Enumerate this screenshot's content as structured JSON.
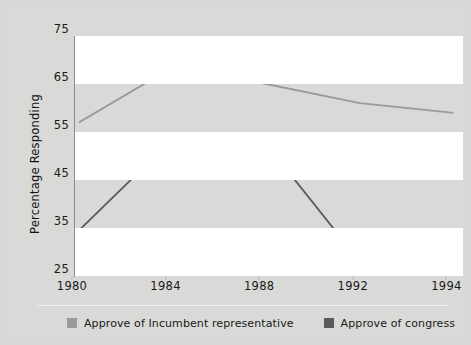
{
  "chart_data": {
    "type": "line",
    "title": "",
    "xlabel": "",
    "ylabel": "Percentage Responding",
    "x": [
      "1980",
      "1984",
      "1988",
      "1992",
      "1994"
    ],
    "categories": [
      "1980",
      "1984",
      "1988",
      "1992",
      "1994"
    ],
    "xtick_labels": [
      "1980",
      "1984",
      "1988",
      "1992",
      "1994"
    ],
    "ytick_labels": [
      "75",
      "65",
      "55",
      "45",
      "35",
      "25"
    ],
    "ytick_values": [
      75,
      65,
      55,
      45,
      35,
      25
    ],
    "ylim": [
      25,
      75
    ],
    "grid": false,
    "banded_background": true,
    "legend_position": "bottom-left",
    "series": [
      {
        "name": "Approve of Incumbent representative",
        "color": "#9a9a9a",
        "values": [
          57,
          68.5,
          65,
          61,
          59
        ]
      },
      {
        "name": "Approve of congress",
        "color": "#5a5a5a",
        "values": [
          34.5,
          53.5,
          52.5,
          28,
          30
        ]
      }
    ]
  },
  "axis": {
    "y_title": "Percentage Responding",
    "y_ticks": [
      "75",
      "65",
      "55",
      "45",
      "35",
      "25"
    ],
    "x_ticks": [
      "1980",
      "1984",
      "1988",
      "1992",
      "1994"
    ]
  },
  "legend": {
    "items": [
      {
        "label": "Approve of Incumbent representative",
        "color": "#9a9a9a"
      },
      {
        "label": "Approve of congress",
        "color": "#5a5a5a"
      }
    ]
  },
  "colors": {
    "background": "#d9d9d7",
    "band_light": "#ffffff",
    "series_incumbent": "#9a9a9a",
    "series_congress": "#5a5a5a",
    "axis": "#8c8c8c",
    "text": "#1a1a1a"
  }
}
